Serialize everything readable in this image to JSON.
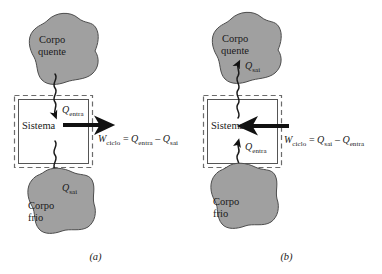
{
  "figure": {
    "type": "thermodynamic-cycle-diagram",
    "colors": {
      "body_fill": "#a0a0a0",
      "body_stroke": "#4d4d4d",
      "boundary_dashed": "#6b6b6b",
      "boundary_solid": "#555555",
      "arrow": "#111111",
      "text": "#1a1a1a",
      "background": "#ffffff"
    },
    "panels": [
      {
        "caption": "(a)",
        "cycle_type": "power-cycle",
        "hot_body": {
          "line1": "Corpo",
          "line2": "quente"
        },
        "cold_body": {
          "line1": "Corpo",
          "line2": "frio"
        },
        "system_label": "Sistema",
        "heat_in": {
          "symbol": "Q",
          "subscript": "entra",
          "direction": "down",
          "from": "hot_body",
          "to": "system"
        },
        "heat_out": {
          "symbol": "Q",
          "subscript": "sai",
          "direction": "down",
          "from": "system",
          "to": "cold_body"
        },
        "work": {
          "symbol": "W",
          "subscript": "ciclo",
          "direction": "right",
          "equation": {
            "lhs_symbol": "W",
            "lhs_subscript": "ciclo",
            "equals": "=",
            "term1_symbol": "Q",
            "term1_subscript": "entra",
            "operator": "–",
            "term2_symbol": "Q",
            "term2_subscript": "sai"
          }
        }
      },
      {
        "caption": "(b)",
        "cycle_type": "refrigeration-heat-pump-cycle",
        "hot_body": {
          "line1": "Corpo",
          "line2": "quente"
        },
        "cold_body": {
          "line1": "Corpo",
          "line2": "frio"
        },
        "system_label": "Sistema",
        "heat_in": {
          "symbol": "Q",
          "subscript": "entra",
          "direction": "up",
          "from": "cold_body",
          "to": "system"
        },
        "heat_out": {
          "symbol": "Q",
          "subscript": "sai",
          "direction": "up",
          "from": "system",
          "to": "hot_body"
        },
        "work": {
          "symbol": "W",
          "subscript": "ciclo",
          "direction": "left",
          "equation": {
            "lhs_symbol": "W",
            "lhs_subscript": "ciclo",
            "equals": "=",
            "term1_symbol": "Q",
            "term1_subscript": "sai",
            "operator": "–",
            "term2_symbol": "Q",
            "term2_subscript": "entra"
          }
        }
      }
    ]
  }
}
